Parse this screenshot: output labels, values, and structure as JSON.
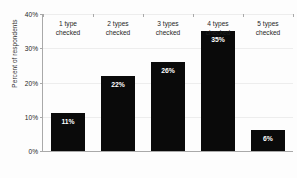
{
  "chart_data": {
    "type": "bar",
    "title": "",
    "xlabel": "",
    "ylabel": "Percent of respondents",
    "categories": [
      "1 type checked",
      "2 types checked",
      "3 types checked",
      "4 types checked",
      "5 types checked"
    ],
    "category_lines": [
      [
        "1 type",
        "checked"
      ],
      [
        "2 types",
        "checked"
      ],
      [
        "3 types",
        "checked"
      ],
      [
        "4 types",
        "checked"
      ],
      [
        "5 types",
        "checked"
      ]
    ],
    "values": [
      11,
      22,
      26,
      35,
      6
    ],
    "data_labels": [
      "11%",
      "22%",
      "26%",
      "35%",
      "6%"
    ],
    "ylim": [
      0,
      40
    ],
    "yticks": [
      0,
      10,
      20,
      30,
      40
    ],
    "ytick_labels": [
      "0%",
      "10%",
      "20%",
      "30%",
      "40%"
    ],
    "grid": true,
    "legend": false,
    "bar_color": "#0a0a0a",
    "data_label_color": "#ffffff",
    "axis_color": "#a9a9a9",
    "gridline_color": "#ededed",
    "background_color": "#fdfdfd"
  }
}
